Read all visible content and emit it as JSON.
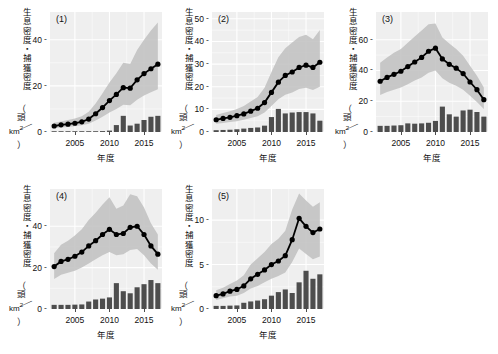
{
  "figure": {
    "axis_titles": {
      "y_chars": [
        "生",
        "息",
        "密",
        "度",
        "・",
        "捕",
        "獲",
        "密",
        "度"
      ],
      "y_paren_open": "（",
      "y_head": "頭",
      "y_slash": "／",
      "y_km": "km",
      "y_km_sup": "2",
      "y_paren_close": "）",
      "y_full": "生息密度・捕獲密度（頭／km2）",
      "x": "年度"
    },
    "colors": {
      "panel_background": "#efefef",
      "gridline": "#ffffff",
      "ribbon": "#bfbfbf",
      "line": "#000000",
      "point": "#000000",
      "bar": "#4d4d4d",
      "text": "#111111"
    }
  },
  "chart_data": [
    {
      "type": "line",
      "title": "(1)",
      "xlabel": "年度",
      "ylabel": "生息密度・捕獲密度（頭／km2）",
      "xlim": [
        2001.4,
        2017.6
      ],
      "ylim": [
        0,
        52
      ],
      "xticks": [
        2005,
        2010,
        2015
      ],
      "yticks": [
        0,
        20,
        40
      ],
      "grid": true,
      "x": [
        2002,
        2003,
        2004,
        2005,
        2006,
        2007,
        2008,
        2009,
        2010,
        2011,
        2012,
        2013,
        2014,
        2015,
        2016,
        2017
      ],
      "series": [
        {
          "name": "生息密度",
          "kind": "line-point",
          "values": [
            2.6,
            3.1,
            3.4,
            3.8,
            4.4,
            5.6,
            7.9,
            10.6,
            13.6,
            16.3,
            19.2,
            19.0,
            22.6,
            25.3,
            27.4,
            29.4
          ]
        },
        {
          "name": "生息密度 上限",
          "kind": "ribbon-upper",
          "values": [
            4.0,
            4.6,
            5.2,
            5.8,
            6.8,
            8.8,
            12.4,
            16.8,
            21.4,
            25.5,
            30.0,
            29.5,
            35.5,
            40.0,
            44.0,
            47.5
          ]
        },
        {
          "name": "生息密度 下限",
          "kind": "ribbon-lower",
          "values": [
            1.6,
            1.9,
            2.2,
            2.5,
            2.9,
            3.6,
            5.0,
            6.6,
            8.4,
            10.0,
            11.8,
            11.6,
            14.0,
            15.8,
            17.2,
            18.5
          ]
        },
        {
          "name": "捕獲密度",
          "kind": "bar",
          "values": [
            0.08,
            0.08,
            0.1,
            0.12,
            0.15,
            0.2,
            0.3,
            0.4,
            0.6,
            3.0,
            7.0,
            2.8,
            3.6,
            5.2,
            6.6,
            7.0
          ]
        }
      ],
      "extra_points_x": [
        2016.6,
        2017.3
      ],
      "extra_points_y": [
        35.5,
        36.0
      ]
    },
    {
      "type": "line",
      "title": "(2)",
      "xlabel": "年度",
      "ylabel": "生息密度・捕獲密度（頭／km2）",
      "xlim": [
        2001.4,
        2017.6
      ],
      "ylim": [
        0,
        53
      ],
      "xticks": [
        2005,
        2010,
        2015
      ],
      "yticks": [
        0,
        10,
        20,
        30,
        40,
        50
      ],
      "grid": true,
      "x": [
        2002,
        2003,
        2004,
        2005,
        2006,
        2007,
        2008,
        2009,
        2010,
        2011,
        2012,
        2013,
        2014,
        2015,
        2016,
        2017
      ],
      "series": [
        {
          "name": "生息密度",
          "kind": "line-point",
          "values": [
            5.4,
            6.0,
            6.5,
            7.2,
            8.0,
            9.2,
            10.5,
            13.0,
            17.5,
            22.0,
            25.0,
            26.5,
            28.5,
            29.5,
            28.5,
            30.8
          ]
        },
        {
          "name": "生息密度 上限",
          "kind": "ribbon-upper",
          "values": [
            7.5,
            8.4,
            9.2,
            10.2,
            11.5,
            13.5,
            15.5,
            19.5,
            26.5,
            33.0,
            37.0,
            39.5,
            42.0,
            43.0,
            41.0,
            45.0
          ]
        },
        {
          "name": "生息密度 下限",
          "kind": "ribbon-lower",
          "values": [
            3.6,
            4.0,
            4.4,
            4.8,
            5.4,
            6.2,
            7.0,
            8.6,
            11.5,
            14.5,
            16.5,
            17.5,
            19.0,
            19.5,
            18.5,
            20.0
          ]
        },
        {
          "name": "捕獲密度",
          "kind": "bar",
          "values": [
            0.8,
            0.9,
            1.0,
            1.2,
            1.5,
            1.8,
            2.0,
            2.8,
            6.6,
            10.2,
            8.2,
            8.6,
            8.8,
            8.8,
            8.2,
            5.0
          ]
        }
      ]
    },
    {
      "type": "line",
      "title": "(3)",
      "xlabel": "年度",
      "ylabel": "生息密度・捕獲密度（頭／km2）",
      "xlim": [
        2001.4,
        2017.6
      ],
      "ylim": [
        0,
        78
      ],
      "xticks": [
        2005,
        2010,
        2015
      ],
      "yticks": [
        0,
        20,
        40,
        60
      ],
      "grid": true,
      "x": [
        2002,
        2003,
        2004,
        2005,
        2006,
        2007,
        2008,
        2009,
        2010,
        2011,
        2012,
        2013,
        2014,
        2015,
        2016,
        2017
      ],
      "series": [
        {
          "name": "生息密度",
          "kind": "line-point",
          "values": [
            33.0,
            35.5,
            37.5,
            39.5,
            42.5,
            45.5,
            48.5,
            52.5,
            54.5,
            47.5,
            44.0,
            41.5,
            38.0,
            32.5,
            27.5,
            21.0
          ]
        },
        {
          "name": "生息密度 上限",
          "kind": "ribbon-upper",
          "values": [
            45.0,
            48.5,
            51.5,
            54.0,
            58.0,
            62.0,
            66.0,
            70.0,
            70.5,
            61.5,
            57.5,
            54.0,
            49.5,
            43.0,
            36.5,
            29.0
          ]
        },
        {
          "name": "生息密度 下限",
          "kind": "ribbon-lower",
          "values": [
            24.0,
            26.0,
            27.5,
            29.0,
            31.0,
            33.5,
            35.5,
            38.5,
            40.0,
            35.0,
            32.0,
            30.0,
            27.5,
            23.5,
            19.5,
            15.0
          ]
        },
        {
          "name": "捕獲密度",
          "kind": "bar",
          "values": [
            4.0,
            4.0,
            4.2,
            4.4,
            5.6,
            5.4,
            5.6,
            6.0,
            7.2,
            16.5,
            11.5,
            10.0,
            14.0,
            14.5,
            13.0,
            10.0
          ]
        }
      ]
    },
    {
      "type": "line",
      "title": "(4)",
      "xlabel": "年度",
      "ylabel": "生息密度・捕獲密度（頭／km2）",
      "xlim": [
        2001.4,
        2017.6
      ],
      "ylim": [
        0,
        58
      ],
      "xticks": [
        2005,
        2010,
        2015
      ],
      "yticks": [
        0,
        20,
        40
      ],
      "grid": true,
      "x": [
        2002,
        2003,
        2004,
        2005,
        2006,
        2007,
        2008,
        2009,
        2010,
        2011,
        2012,
        2013,
        2014,
        2015,
        2016,
        2017
      ],
      "series": [
        {
          "name": "生息密度",
          "kind": "line-point",
          "values": [
            20.5,
            23.0,
            24.0,
            25.5,
            27.5,
            30.5,
            33.0,
            36.0,
            38.5,
            36.0,
            36.5,
            39.5,
            40.0,
            36.0,
            30.5,
            26.5
          ]
        },
        {
          "name": "生息密度 上限",
          "kind": "ribbon-upper",
          "values": [
            27.0,
            31.0,
            33.0,
            35.5,
            38.5,
            43.0,
            46.5,
            50.5,
            54.0,
            48.5,
            50.0,
            55.5,
            54.5,
            49.0,
            41.5,
            36.0
          ]
        },
        {
          "name": "生息密度 下限",
          "kind": "ribbon-lower",
          "values": [
            14.5,
            16.5,
            17.5,
            18.5,
            20.0,
            22.0,
            24.0,
            26.0,
            27.5,
            26.0,
            26.5,
            28.5,
            29.0,
            26.0,
            22.0,
            19.0
          ]
        },
        {
          "name": "捕獲密度",
          "kind": "bar",
          "values": [
            2.0,
            2.0,
            2.0,
            2.1,
            2.2,
            3.6,
            4.6,
            5.0,
            5.6,
            12.5,
            8.6,
            7.6,
            10.5,
            12.0,
            14.0,
            12.5
          ]
        }
      ]
    },
    {
      "type": "line",
      "title": "(5)",
      "xlabel": "年度",
      "ylabel": "生息密度・捕獲密度（頭／km2）",
      "xlim": [
        2001.4,
        2017.6
      ],
      "ylim": [
        0,
        13.5
      ],
      "xticks": [
        2005,
        2010,
        2015
      ],
      "yticks": [
        0,
        5,
        10
      ],
      "grid": true,
      "x": [
        2002,
        2003,
        2004,
        2005,
        2006,
        2007,
        2008,
        2009,
        2010,
        2011,
        2012,
        2013,
        2014,
        2015,
        2016,
        2017
      ],
      "series": [
        {
          "name": "生息密度",
          "kind": "line-point",
          "values": [
            1.5,
            1.7,
            2.0,
            2.2,
            2.6,
            3.4,
            3.9,
            4.4,
            5.0,
            5.4,
            6.0,
            7.8,
            10.2,
            9.3,
            8.6,
            9.0
          ]
        },
        {
          "name": "生息密度 上限",
          "kind": "ribbon-upper",
          "values": [
            2.1,
            2.4,
            2.8,
            3.2,
            3.8,
            5.0,
            5.7,
            6.4,
            7.3,
            7.9,
            8.8,
            11.2,
            13.0,
            12.2,
            11.5,
            12.0
          ]
        },
        {
          "name": "生息密度 下限",
          "kind": "ribbon-lower",
          "values": [
            1.0,
            1.2,
            1.4,
            1.5,
            1.8,
            2.3,
            2.6,
            3.0,
            3.4,
            3.7,
            4.1,
            5.3,
            6.8,
            6.2,
            5.6,
            5.9
          ]
        },
        {
          "name": "捕獲密度",
          "kind": "bar",
          "values": [
            0.35,
            0.35,
            0.38,
            0.4,
            0.7,
            0.85,
            0.95,
            1.1,
            1.5,
            1.9,
            2.2,
            1.8,
            3.0,
            4.3,
            3.4,
            3.9
          ]
        }
      ]
    }
  ]
}
